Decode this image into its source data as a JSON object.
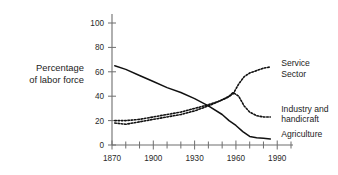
{
  "chart_data": {
    "type": "line",
    "title": "",
    "subtitle": "",
    "xlabel": "",
    "ylabel": "Percentage\nof labor force",
    "xlim": [
      1870,
      2000
    ],
    "ylim": [
      0,
      100
    ],
    "grid": false,
    "legend_position": "right-inline",
    "x_ticks_major": [
      1870,
      1900,
      1930,
      1960,
      1990
    ],
    "x_tick_labels": [
      "1870",
      "1900",
      "1930",
      "1960",
      "1990"
    ],
    "x_ticks_minor_step": 10,
    "y_ticks": [
      0,
      20,
      40,
      60,
      80,
      100
    ],
    "y_tick_labels": [
      "0",
      "20",
      "40",
      "60",
      "80",
      "100"
    ],
    "series": [
      {
        "name": "Agriculture",
        "style": "solid",
        "color": "#111111",
        "x": [
          1872,
          1880,
          1890,
          1900,
          1910,
          1920,
          1930,
          1940,
          1950,
          1955,
          1960,
          1965,
          1970,
          1975,
          1980,
          1985
        ],
        "values": [
          65,
          62,
          57,
          52,
          47,
          43,
          38,
          32,
          25,
          20,
          16,
          11,
          7,
          6,
          5.5,
          5
        ]
      },
      {
        "name": "Industry and\nhandicraft",
        "style": "dotted",
        "color": "#111111",
        "x": [
          1872,
          1880,
          1890,
          1900,
          1910,
          1920,
          1930,
          1940,
          1950,
          1955,
          1958,
          1962,
          1966,
          1970,
          1975,
          1980,
          1985
        ],
        "values": [
          18,
          17,
          19,
          21,
          23,
          25,
          28,
          32,
          37,
          40,
          43,
          40,
          32,
          27,
          24,
          23,
          23
        ]
      },
      {
        "name": "Service\nSector",
        "style": "dotted",
        "color": "#111111",
        "x": [
          1872,
          1880,
          1890,
          1900,
          1910,
          1920,
          1930,
          1940,
          1948,
          1954,
          1958,
          1962,
          1966,
          1970,
          1975,
          1980,
          1985
        ],
        "values": [
          20,
          20,
          21,
          23,
          25,
          27,
          30,
          33,
          36,
          39,
          42,
          50,
          56,
          59,
          61,
          63,
          64
        ]
      }
    ],
    "series_labels": [
      {
        "text": "Service\nSector",
        "anchor_x": 1990,
        "anchor_y": 66
      },
      {
        "text": "Industry and\nhandicraft",
        "anchor_x": 1990,
        "anchor_y": 29
      },
      {
        "text": "Agriculture",
        "anchor_x": 1990,
        "anchor_y": 8
      }
    ]
  }
}
